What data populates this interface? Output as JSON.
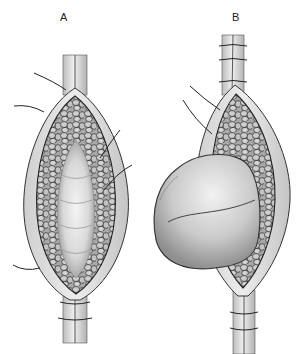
{
  "figure": {
    "panels": [
      {
        "label": "A",
        "description": "Longitudinal incision opened, exposing inner lumen with cobblestone-textured lining and suture stay threads"
      },
      {
        "label": "B",
        "description": "Opened incision with large bulging mass herniating out to the left side"
      }
    ]
  },
  "colors": {
    "ink": "#2a2a2a",
    "tissue_light": "#e6e6e6",
    "tissue_mid": "#bdbdbd",
    "tissue_dark": "#8a8a8a",
    "background": "#ffffff"
  }
}
